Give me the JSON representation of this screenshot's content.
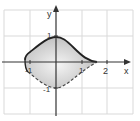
{
  "figure": {
    "title": "",
    "x_axis_label": "x",
    "y_axis_label": "y",
    "x_tick_labels": [
      {
        "value": -1,
        "label": "-1"
      },
      {
        "value": 1,
        "label": "1"
      },
      {
        "value": 2,
        "label": "2"
      }
    ],
    "y_tick_labels": [
      {
        "value": 1,
        "label": "1"
      },
      {
        "value": -1,
        "label": "-1"
      }
    ],
    "grid": {
      "x_min": -2,
      "x_max": 3,
      "y_min": -2,
      "y_max": 2,
      "step": 1
    },
    "region": {
      "description": "Shaded region bounded above by solid curve and below by dashed curve",
      "left_extent": -1.2,
      "right_tip": 1.6,
      "top_at_x0": 1,
      "bottom_at_x0": -1,
      "upper_boundary_style": "solid",
      "lower_boundary_style": "dashed"
    },
    "colors": {
      "grid": "#d9d9d9",
      "axes": "#333333",
      "boundary": "#222222",
      "fill_light": "#f2f2f2",
      "fill_dark": "#bfbfbf"
    }
  }
}
